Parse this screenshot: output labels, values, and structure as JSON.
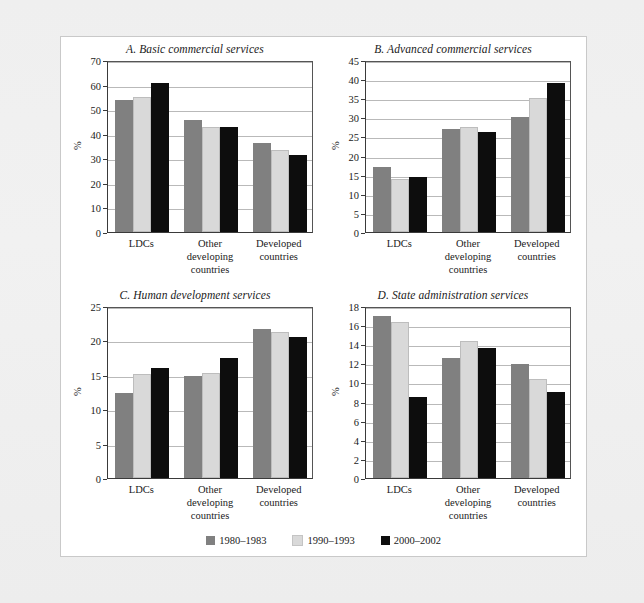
{
  "figure": {
    "series_labels": [
      "1980–1983",
      "1990–1993",
      "2000–2002"
    ],
    "series_colors": [
      "#808080",
      "#d9d9d9",
      "#0d0d0d"
    ],
    "categories": [
      [
        "LDCs"
      ],
      [
        "Other",
        "developing",
        "countries"
      ],
      [
        "Developed",
        "countries"
      ]
    ],
    "ylabel": "%"
  },
  "chart_data": [
    {
      "type": "bar",
      "panel": "A",
      "title": "A. Basic commercial services",
      "categories": [
        "LDCs",
        "Other developing countries",
        "Developed countries"
      ],
      "series": [
        {
          "name": "1980–1983",
          "values": [
            53.7,
            45.6,
            36.2
          ]
        },
        {
          "name": "1990–1993",
          "values": [
            54.8,
            42.8,
            33.5
          ]
        },
        {
          "name": "2000–2002",
          "values": [
            60.8,
            42.6,
            31.4
          ]
        }
      ],
      "xlabel": "",
      "ylabel": "%",
      "ylim": [
        0,
        70
      ],
      "yticks": [
        0,
        10,
        20,
        30,
        40,
        50,
        60,
        70
      ],
      "grid": true,
      "legend_position": "bottom"
    },
    {
      "type": "bar",
      "panel": "B",
      "title": "B. Advanced commercial services",
      "categories": [
        "LDCs",
        "Other developing countries",
        "Developed countries"
      ],
      "series": [
        {
          "name": "1980–1983",
          "values": [
            17.0,
            27.0,
            30.2
          ]
        },
        {
          "name": "1990–1993",
          "values": [
            14.0,
            27.4,
            35.0
          ]
        },
        {
          "name": "2000–2002",
          "values": [
            14.5,
            26.2,
            39.0
          ]
        }
      ],
      "xlabel": "",
      "ylabel": "%",
      "ylim": [
        0,
        45
      ],
      "yticks": [
        0,
        5,
        10,
        15,
        20,
        25,
        30,
        35,
        40,
        45
      ],
      "grid": true,
      "legend_position": "bottom"
    },
    {
      "type": "bar",
      "panel": "C",
      "title": "C. Human development services",
      "categories": [
        "LDCs",
        "Other developing countries",
        "Developed countries"
      ],
      "series": [
        {
          "name": "1980–1983",
          "values": [
            12.4,
            14.9,
            21.6
          ]
        },
        {
          "name": "1990–1993",
          "values": [
            15.1,
            15.2,
            21.2
          ]
        },
        {
          "name": "2000–2002",
          "values": [
            16.0,
            17.4,
            20.5
          ]
        }
      ],
      "xlabel": "",
      "ylabel": "%",
      "ylim": [
        0,
        25
      ],
      "yticks": [
        0,
        5,
        10,
        15,
        20,
        25
      ],
      "grid": true,
      "legend_position": "bottom"
    },
    {
      "type": "bar",
      "panel": "D",
      "title": "D. State administration services",
      "categories": [
        "LDCs",
        "Other developing countries",
        "Developed countries"
      ],
      "series": [
        {
          "name": "1980–1983",
          "values": [
            17.0,
            12.6,
            11.9
          ]
        },
        {
          "name": "1990–1993",
          "values": [
            16.3,
            14.3,
            10.4
          ]
        },
        {
          "name": "2000–2002",
          "values": [
            8.5,
            13.6,
            9.0
          ]
        }
      ],
      "xlabel": "",
      "ylabel": "%",
      "ylim": [
        0,
        18
      ],
      "yticks": [
        0,
        2,
        4,
        6,
        8,
        10,
        12,
        14,
        16,
        18
      ],
      "grid": true,
      "legend_position": "bottom"
    }
  ]
}
